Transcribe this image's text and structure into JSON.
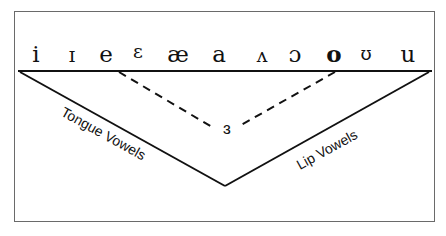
{
  "diagram": {
    "vowels": [
      {
        "symbol": "i",
        "x": 36
      },
      {
        "symbol": "ɪ",
        "x": 72
      },
      {
        "symbol": "e",
        "x": 106
      },
      {
        "symbol": "ɛ",
        "x": 138
      },
      {
        "symbol": "æ",
        "x": 178
      },
      {
        "symbol": "a",
        "x": 219
      },
      {
        "symbol": "ʌ",
        "x": 262
      },
      {
        "symbol": "ɔ",
        "x": 295
      },
      {
        "symbol": "o",
        "x": 334
      },
      {
        "symbol": "ʊ",
        "x": 366
      },
      {
        "symbol": "u",
        "x": 408
      }
    ],
    "center_vowel": "ɜ",
    "left_label": "Tongue Vowels",
    "right_label": "Lip Vowels",
    "colors": {
      "line": "#111111",
      "border": "#6a6a6a",
      "background": "#ffffff"
    }
  }
}
